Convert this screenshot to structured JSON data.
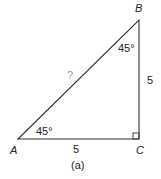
{
  "figure": {
    "vertices": {
      "A": "A",
      "B": "B",
      "C": "C"
    },
    "sides": {
      "AC": "5",
      "BC": "5",
      "AB": "?"
    },
    "angles": {
      "A": "45°",
      "B": "45°",
      "C": "right-angle"
    },
    "caption": "(a)"
  }
}
